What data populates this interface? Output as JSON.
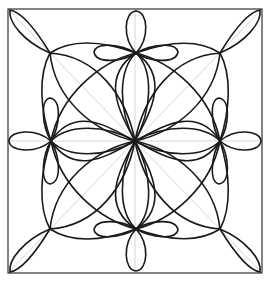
{
  "diagram": {
    "type": "geometric-rosette-pattern",
    "colors": {
      "background": "#ffffff",
      "lines": "#1a1a1a",
      "guides": "#d6d6d6",
      "frame": "#333333"
    },
    "frame": {
      "x": 8,
      "y": 9,
      "width": 254,
      "height": 264
    },
    "center": {
      "x": 135,
      "y": 141
    },
    "flowers": [
      {
        "name": "top",
        "x": 136,
        "y": 53
      },
      {
        "name": "bottom",
        "x": 136,
        "y": 229
      },
      {
        "name": "left",
        "x": 51,
        "y": 141
      },
      {
        "name": "right",
        "x": 220,
        "y": 141
      }
    ]
  }
}
